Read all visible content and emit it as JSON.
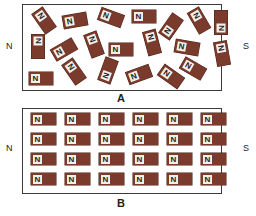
{
  "colors": {
    "magnet_body": "#7a3b2c",
    "magnet_label_bg": "#f3efe8",
    "frame_border": "#3a3a3a"
  },
  "panelA": {
    "caption": "A",
    "left_pole": "N",
    "right_pole": "S",
    "description": "Randomly oriented magnetic domains",
    "magnets": [
      {
        "label": "N",
        "x": 28,
        "y": 14,
        "rot": 55
      },
      {
        "label": "N",
        "x": 59,
        "y": 14,
        "rot": -10
      },
      {
        "label": "N",
        "x": 95,
        "y": 11,
        "rot": 20
      },
      {
        "label": "N",
        "x": 128,
        "y": 10,
        "rot": 0
      },
      {
        "label": "N",
        "x": 155,
        "y": 20,
        "rot": -55
      },
      {
        "label": "N",
        "x": 183,
        "y": 14,
        "rot": 60
      },
      {
        "label": "N",
        "x": 205,
        "y": 16,
        "rot": -90
      },
      {
        "label": "N",
        "x": 22,
        "y": 40,
        "rot": 90
      },
      {
        "label": "N",
        "x": 48,
        "y": 43,
        "rot": -30
      },
      {
        "label": "N",
        "x": 78,
        "y": 38,
        "rot": 70
      },
      {
        "label": "N",
        "x": 105,
        "y": 43,
        "rot": 0
      },
      {
        "label": "N",
        "x": 136,
        "y": 36,
        "rot": 75
      },
      {
        "label": "N",
        "x": 171,
        "y": 41,
        "rot": 10
      },
      {
        "label": "N",
        "x": 206,
        "y": 47,
        "rot": 80
      },
      {
        "label": "N",
        "x": 25,
        "y": 72,
        "rot": 0
      },
      {
        "label": "N",
        "x": 58,
        "y": 65,
        "rot": 55
      },
      {
        "label": "N",
        "x": 92,
        "y": 64,
        "rot": -70
      },
      {
        "label": "N",
        "x": 123,
        "y": 68,
        "rot": -20
      },
      {
        "label": "N",
        "x": 155,
        "y": 70,
        "rot": 35
      },
      {
        "label": "N",
        "x": 177,
        "y": 62,
        "rot": 30
      }
    ]
  },
  "panelB": {
    "caption": "B",
    "left_pole": "N",
    "right_pole": "S",
    "description": "Aligned magnetic domains",
    "rows": 4,
    "cols": 6,
    "label": "N"
  }
}
